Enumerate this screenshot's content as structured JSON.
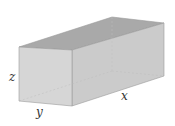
{
  "diagram": {
    "type": "rectangular-box",
    "labels": {
      "x": "x",
      "y": "y",
      "z": "z"
    },
    "colors": {
      "top_face": "#a9a9a9",
      "front_face": "#d6d6d6",
      "right_face": "#cbcbcb",
      "edge": "#9a9a9a",
      "hidden_edge": "#bdbdbd",
      "label": "#333333"
    }
  }
}
